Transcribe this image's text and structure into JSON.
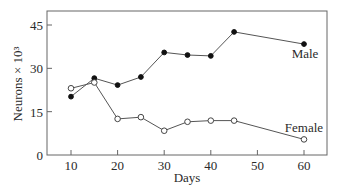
{
  "chart_data": {
    "type": "line",
    "title": "",
    "xlabel": "Days",
    "ylabel": "Neurons × 10³",
    "xlim": [
      5,
      65
    ],
    "ylim": [
      0,
      50
    ],
    "xticks": [
      10,
      20,
      30,
      40,
      50,
      60
    ],
    "yticks": [
      0,
      15,
      30,
      45
    ],
    "xtick_labels": [
      "10",
      "20",
      "30",
      "40",
      "50",
      "60"
    ],
    "ytick_labels": [
      "0",
      "15",
      "30",
      "45"
    ],
    "grid": false,
    "legend": "inline labels at right end of each series",
    "x": [
      10,
      15,
      20,
      25,
      30,
      35,
      40,
      45,
      60
    ],
    "series": [
      {
        "name": "Male",
        "marker": "filled-circle",
        "values": [
          20.2,
          26.6,
          24.2,
          27.0,
          35.5,
          34.6,
          34.3,
          42.6,
          38.4
        ]
      },
      {
        "name": "Female",
        "marker": "open-circle",
        "values": [
          23.1,
          25.1,
          12.5,
          13.1,
          8.4,
          11.5,
          11.9,
          11.9,
          5.4
        ]
      }
    ],
    "colors": {
      "line": "#555555",
      "axis": "#666666",
      "text": "#2a2a2a",
      "male_marker": "#111111",
      "female_marker_fill": "#ffffff"
    }
  }
}
